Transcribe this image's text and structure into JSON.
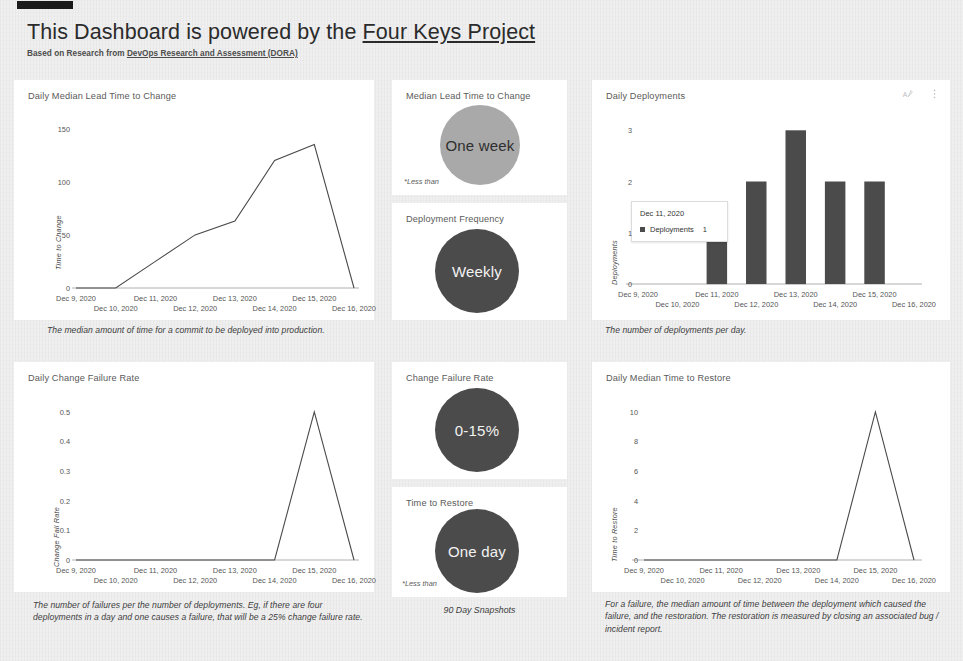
{
  "header": {
    "title_prefix": "This Dashboard is powered by the ",
    "title_link": "Four Keys Project",
    "subtitle_prefix": "Based on Research from ",
    "subtitle_link": "DevOps Research and Assessment (DORA)"
  },
  "panels": {
    "lead_time_chart": {
      "title": "Daily Median Lead Time to Change",
      "caption": "The median amount of time for a commit to be deployed into production."
    },
    "deployments_chart": {
      "title": "Daily Deployments",
      "caption": "The number of deployments per day.",
      "icons": [
        "edit-text-icon",
        "more-vert-icon"
      ],
      "tooltip": {
        "date": "Dec 11, 2020",
        "series": "Deployments",
        "value": "1"
      }
    },
    "change_failure_chart": {
      "title": "Daily Change Failure Rate",
      "caption": "The number of failures per the number of deployments. Eg, if there are four deployments in a day and one causes a failure, that will be a 25% change failure rate."
    },
    "time_to_restore_chart": {
      "title": "Daily Median Time to Restore",
      "caption": "For a failure, the median amount of time between the deployment which caused the failure, and the restoration. The restoration is measured by closing an associated bug / incident report."
    }
  },
  "metrics": [
    {
      "title": "Median Lead Time to Change",
      "value": "One week",
      "style": "light",
      "footnote": "*Less than"
    },
    {
      "title": "Deployment Frequency",
      "value": "Weekly",
      "style": "dark",
      "footnote": ""
    },
    {
      "title": "Change Failure Rate",
      "value": "0-15%",
      "style": "dark",
      "footnote": ""
    },
    {
      "title": "Time to Restore",
      "value": "One day",
      "style": "dark",
      "footnote": "*Less than"
    }
  ],
  "snapshot_label": "90 Day Snapshots",
  "colors": {
    "bar": "#4b4b4b",
    "line": "#4a4a4a",
    "circle_light": "#a9a9a9",
    "circle_dark": "#4b4b4b",
    "card_bg": "#ffffff",
    "page_bg": "#efefef"
  },
  "chart_data": [
    {
      "id": "lead_time",
      "type": "line",
      "title": "Daily Median Lead Time to Change",
      "xlabel": "",
      "ylabel": "Time to Change",
      "ylim": [
        0,
        160
      ],
      "yticks": [
        0,
        50,
        100,
        150
      ],
      "grid": false,
      "categories": [
        "Dec 9, 2020",
        "Dec 10, 2020",
        "Dec 11, 2020",
        "Dec 12, 2020",
        "Dec 13, 2020",
        "Dec 14, 2020",
        "Dec 15, 2020",
        "Dec 16, 2020"
      ],
      "values": [
        0,
        0,
        25,
        50,
        63,
        120,
        135,
        0
      ]
    },
    {
      "id": "deployments",
      "type": "bar",
      "title": "Daily Deployments",
      "xlabel": "",
      "ylabel": "Deployments",
      "ylim": [
        0,
        3.2
      ],
      "yticks": [
        0,
        1,
        2,
        3
      ],
      "grid": false,
      "categories": [
        "Dec 9, 2020",
        "Dec 10, 2020",
        "Dec 11, 2020",
        "Dec 12, 2020",
        "Dec 13, 2020",
        "Dec 14, 2020",
        "Dec 15, 2020",
        "Dec 16, 2020"
      ],
      "values": [
        0,
        0,
        1,
        2,
        3,
        2,
        2,
        0
      ]
    },
    {
      "id": "change_failure",
      "type": "line",
      "title": "Daily Change Failure Rate",
      "xlabel": "",
      "ylabel": "Change Fail Rate",
      "ylim": [
        0,
        0.54
      ],
      "yticks": [
        0,
        0.1,
        0.2,
        0.3,
        0.4,
        0.5
      ],
      "ytick_labels": [
        "0",
        "0.1",
        "0.2",
        "0.3",
        "0.4",
        "0.5"
      ],
      "grid": false,
      "categories": [
        "Dec 9, 2020",
        "Dec 10, 2020",
        "Dec 11, 2020",
        "Dec 12, 2020",
        "Dec 13, 2020",
        "Dec 14, 2020",
        "Dec 15, 2020",
        "Dec 16, 2020"
      ],
      "values": [
        0,
        0,
        0,
        0,
        0,
        0,
        0.5,
        0
      ]
    },
    {
      "id": "time_to_restore",
      "type": "line",
      "title": "Daily Median Time to Restore",
      "xlabel": "",
      "ylabel": "Time to Restore",
      "ylim": [
        0,
        10.8
      ],
      "yticks": [
        0,
        2,
        4,
        6,
        8,
        10
      ],
      "grid": false,
      "categories": [
        "Dec 9, 2020",
        "Dec 10, 2020",
        "Dec 11, 2020",
        "Dec 12, 2020",
        "Dec 13, 2020",
        "Dec 14, 2020",
        "Dec 15, 2020",
        "Dec 16, 2020"
      ],
      "values": [
        0,
        0,
        0,
        0,
        0,
        0,
        10,
        0
      ]
    }
  ]
}
